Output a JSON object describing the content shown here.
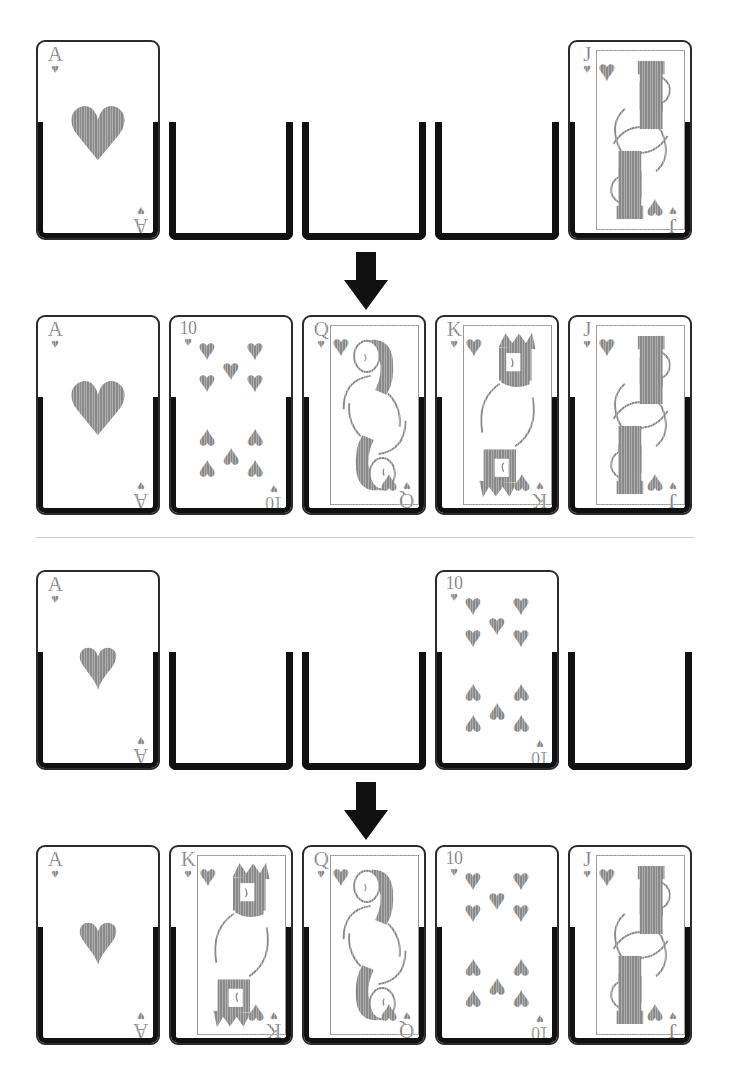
{
  "figure": {
    "suit_symbol": "♥",
    "suit_name": "hearts",
    "ink_color": "#8a8a8a",
    "slot_color": "#111111",
    "divider_color": "#cfcfcf",
    "card_border_color": "#2b2b2b",
    "background": "#ffffff"
  },
  "panels": [
    {
      "id": "panel-1",
      "before": {
        "label": "before",
        "slots": [
          {
            "position": 1,
            "state": "filled",
            "rank": "A",
            "suit": "♥",
            "card_type": "ace"
          },
          {
            "position": 2,
            "state": "empty",
            "rank": "",
            "suit": "",
            "card_type": "none"
          },
          {
            "position": 3,
            "state": "empty",
            "rank": "",
            "suit": "",
            "card_type": "none"
          },
          {
            "position": 4,
            "state": "empty",
            "rank": "",
            "suit": "",
            "card_type": "none"
          },
          {
            "position": 5,
            "state": "filled",
            "rank": "J",
            "suit": "♥",
            "card_type": "jack"
          }
        ]
      },
      "arrow": {
        "direction": "down",
        "name": "down-arrow"
      },
      "after": {
        "label": "after",
        "slots": [
          {
            "position": 1,
            "state": "filled",
            "rank": "A",
            "suit": "♥",
            "card_type": "ace"
          },
          {
            "position": 2,
            "state": "filled",
            "rank": "10",
            "suit": "♥",
            "card_type": "ten"
          },
          {
            "position": 3,
            "state": "filled",
            "rank": "Q",
            "suit": "♥",
            "card_type": "queen"
          },
          {
            "position": 4,
            "state": "filled",
            "rank": "K",
            "suit": "♥",
            "card_type": "king"
          },
          {
            "position": 5,
            "state": "filled",
            "rank": "J",
            "suit": "♥",
            "card_type": "jack"
          }
        ]
      }
    },
    {
      "id": "panel-2",
      "before": {
        "label": "before",
        "slots": [
          {
            "position": 1,
            "state": "filled",
            "rank": "A",
            "suit": "♥",
            "card_type": "ace"
          },
          {
            "position": 2,
            "state": "empty",
            "rank": "",
            "suit": "",
            "card_type": "none"
          },
          {
            "position": 3,
            "state": "empty",
            "rank": "",
            "suit": "",
            "card_type": "none"
          },
          {
            "position": 4,
            "state": "filled",
            "rank": "10",
            "suit": "♥",
            "card_type": "ten"
          },
          {
            "position": 5,
            "state": "empty",
            "rank": "",
            "suit": "",
            "card_type": "none"
          }
        ]
      },
      "arrow": {
        "direction": "down",
        "name": "down-arrow"
      },
      "after": {
        "label": "after",
        "slots": [
          {
            "position": 1,
            "state": "filled",
            "rank": "A",
            "suit": "♥",
            "card_type": "ace"
          },
          {
            "position": 2,
            "state": "filled",
            "rank": "K",
            "suit": "♥",
            "card_type": "king"
          },
          {
            "position": 3,
            "state": "filled",
            "rank": "Q",
            "suit": "♥",
            "card_type": "queen"
          },
          {
            "position": 4,
            "state": "filled",
            "rank": "10",
            "suit": "♥",
            "card_type": "ten"
          },
          {
            "position": 5,
            "state": "filled",
            "rank": "J",
            "suit": "♥",
            "card_type": "jack"
          }
        ]
      }
    }
  ]
}
